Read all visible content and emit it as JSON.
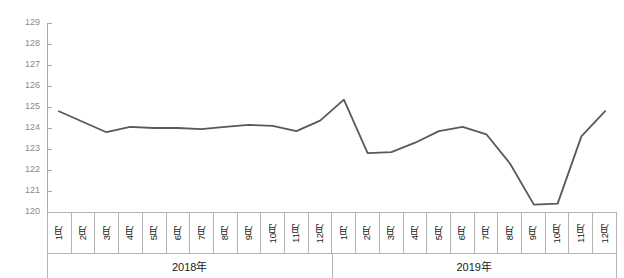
{
  "chart_data": {
    "type": "line",
    "title": "",
    "subtitle": "",
    "xlabel": "",
    "ylabel": "",
    "ylim": [
      120,
      129
    ],
    "yticks": [
      120,
      121,
      122,
      123,
      124,
      125,
      126,
      127,
      128,
      129
    ],
    "ytick_labels": [
      "120",
      "121",
      "122",
      "123",
      "124",
      "125",
      "126",
      "127",
      "128",
      "129"
    ],
    "grid": false,
    "legend": null,
    "legend_position": "none",
    "line_color": "#595959",
    "line_width": 1.8,
    "categories": [
      "1月",
      "2月",
      "3月",
      "4月",
      "5月",
      "6月",
      "7月",
      "8月",
      "9月",
      "10月",
      "11月",
      "12月",
      "1月",
      "2月",
      "3月",
      "4月",
      "5月",
      "6月",
      "7月",
      "8月",
      "9月",
      "10月",
      "11月",
      "12月"
    ],
    "groups": [
      {
        "label": "2018年",
        "span": 12
      },
      {
        "label": "2019年",
        "span": 12
      }
    ],
    "series": [
      {
        "name": "",
        "values": [
          124.8,
          124.3,
          123.8,
          124.05,
          124.0,
          124.0,
          123.95,
          124.05,
          124.15,
          124.1,
          123.85,
          124.35,
          125.35,
          122.8,
          122.85,
          123.3,
          123.85,
          124.05,
          123.7,
          122.3,
          120.35,
          120.4,
          123.6,
          124.8
        ]
      }
    ],
    "values": [
      124.8,
      124.3,
      123.8,
      124.05,
      124.0,
      124.0,
      123.95,
      124.05,
      124.15,
      124.1,
      123.85,
      124.35,
      125.35,
      122.8,
      122.85,
      123.3,
      123.85,
      124.05,
      123.7,
      122.3,
      120.35,
      120.4,
      123.6,
      124.8
    ]
  }
}
